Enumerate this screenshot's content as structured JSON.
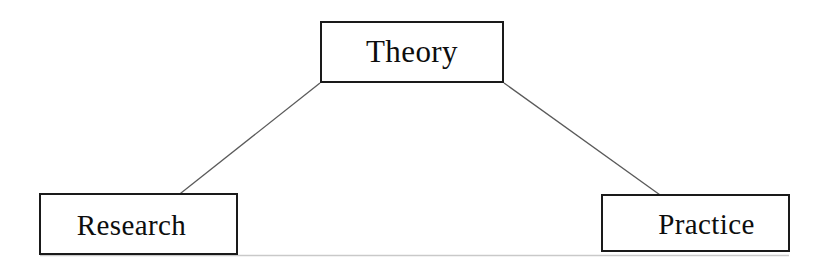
{
  "diagram": {
    "type": "triangle-relationship-diagram",
    "background_color": "#ffffff",
    "nodes": [
      {
        "id": "theory",
        "label": "Theory",
        "position": "top-center",
        "border_color": "#1a1a1a",
        "text_color": "#0d0d0d",
        "fill_color": "#ffffff"
      },
      {
        "id": "research",
        "label": "Research",
        "position": "bottom-left",
        "border_color": "#1a1a1a",
        "text_color": "#0d0d0d",
        "fill_color": "#ffffff"
      },
      {
        "id": "practice",
        "label": "Practice",
        "position": "bottom-right",
        "border_color": "#1a1a1a",
        "text_color": "#0d0d0d",
        "fill_color": "#ffffff"
      }
    ],
    "connectors": [
      {
        "id": "theory-research",
        "from": "theory",
        "to": "research",
        "style": "solid",
        "color": "#5a5a5a",
        "width": 1.3
      },
      {
        "id": "theory-practice",
        "from": "theory",
        "to": "practice",
        "style": "solid",
        "color": "#5a5a5a",
        "width": 1.3
      },
      {
        "id": "research-practice",
        "from": "research",
        "to": "practice",
        "style": "solid",
        "color": "#c9c9c9",
        "width": 1.6
      }
    ]
  }
}
